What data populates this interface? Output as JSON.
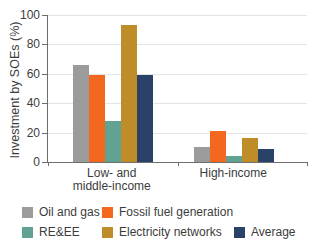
{
  "chart_data": {
    "type": "bar",
    "title": "",
    "ylabel": "Investment by SOEs (%)",
    "xlabel": "",
    "categories": [
      "Low- and middle-income",
      "High-income"
    ],
    "series": [
      {
        "name": "Oil and gas",
        "color": "#9b9b9b",
        "values": [
          66,
          10
        ]
      },
      {
        "name": "Fossil fuel generation",
        "color": "#f4671e",
        "values": [
          59,
          21
        ]
      },
      {
        "name": "RE&EE",
        "color": "#61a292",
        "values": [
          28,
          4
        ]
      },
      {
        "name": "Electricity networks",
        "color": "#bf8c2a",
        "values": [
          93,
          16
        ]
      },
      {
        "name": "Average",
        "color": "#2a4168",
        "values": [
          59,
          9
        ]
      }
    ],
    "ylim": [
      0,
      100
    ],
    "yticks": [
      0,
      20,
      40,
      60,
      80,
      100
    ],
    "grid": true,
    "legend_position": "bottom",
    "legend_rows": [
      [
        0,
        1
      ],
      [
        2,
        3,
        4
      ]
    ],
    "axis_color": "#6e6e6e",
    "gridline_color": "#e4e4e4",
    "text_color": "#3c3c3c"
  }
}
